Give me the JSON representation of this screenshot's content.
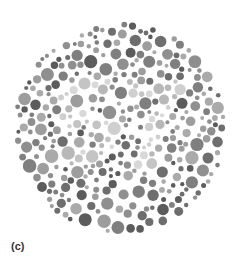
{
  "figure": {
    "type": "ishihara-color-plate",
    "hidden_number": "57",
    "panel_label": "(c)",
    "center": [
      120,
      128
    ],
    "radius": 106,
    "colors": {
      "background_dots": [
        "#5c5c5c",
        "#6e6e6e",
        "#7f7f7f",
        "#8f8f8f",
        "#9d9d9d",
        "#aaaaaa"
      ],
      "figure_dots": [
        "#b8b8b8",
        "#c4c4c4",
        "#cfcfcf",
        "#d8d8d8"
      ]
    }
  }
}
